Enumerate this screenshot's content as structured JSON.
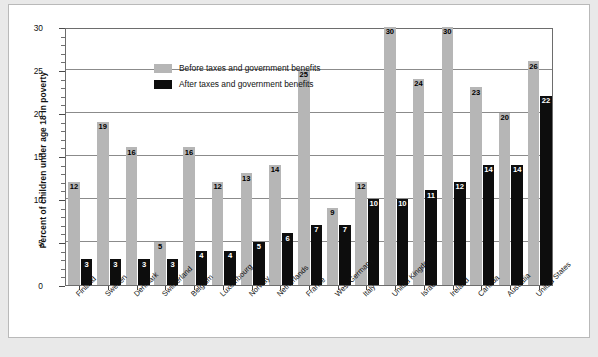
{
  "chart_data": {
    "type": "bar",
    "title": "",
    "xlabel": "",
    "ylabel": "Percent of children under age 18 in poverty",
    "ylim": [
      0,
      30
    ],
    "yticks": [
      0,
      5,
      10,
      15,
      20,
      25,
      30
    ],
    "ytick_labels": [
      "0",
      "5",
      "10",
      "15",
      "20",
      "25",
      "30"
    ],
    "grid": true,
    "legend_position": "top-left",
    "categories": [
      "Finland",
      "Sweden",
      "Denmark",
      "Switzerland",
      "Belgium",
      "Luxembourg",
      "Norway",
      "Netherlands",
      "France",
      "West Germany",
      "Italy",
      "United Kingdom",
      "Israel",
      "Ireland",
      "Canada",
      "Australia",
      "United States"
    ],
    "series": [
      {
        "name": "Before taxes and government benefits",
        "color": "#b6b6b6",
        "values": [
          12,
          19,
          16,
          5,
          16,
          12,
          13,
          14,
          25,
          9,
          12,
          30,
          24,
          30,
          23,
          20,
          26
        ]
      },
      {
        "name": "After taxes and government benefits",
        "color": "#0d0d0d",
        "values": [
          3,
          3,
          3,
          3,
          4,
          4,
          5,
          6,
          7,
          7,
          10,
          10,
          11,
          12,
          14,
          14,
          22
        ]
      }
    ]
  },
  "legend": {
    "items": [
      {
        "label": "Before taxes and government benefits",
        "swatch": "before"
      },
      {
        "label": "After taxes and government benefits",
        "swatch": "after"
      }
    ]
  }
}
